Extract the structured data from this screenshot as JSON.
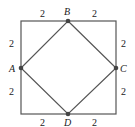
{
  "figure": {
    "outer_square": {
      "stroke": "#555555"
    },
    "inner_square": {
      "stroke": "#555555"
    },
    "points": [
      {
        "name": "A",
        "label": "A"
      },
      {
        "name": "B",
        "label": "B"
      },
      {
        "name": "C",
        "label": "C"
      },
      {
        "name": "D",
        "label": "D"
      }
    ],
    "segment_labels": {
      "top_left": "2",
      "top_right": "2",
      "left_top": "2",
      "left_bottom": "2",
      "right_top": "2",
      "right_bottom": "2",
      "bottom_left": "2",
      "bottom_right": "2"
    }
  }
}
